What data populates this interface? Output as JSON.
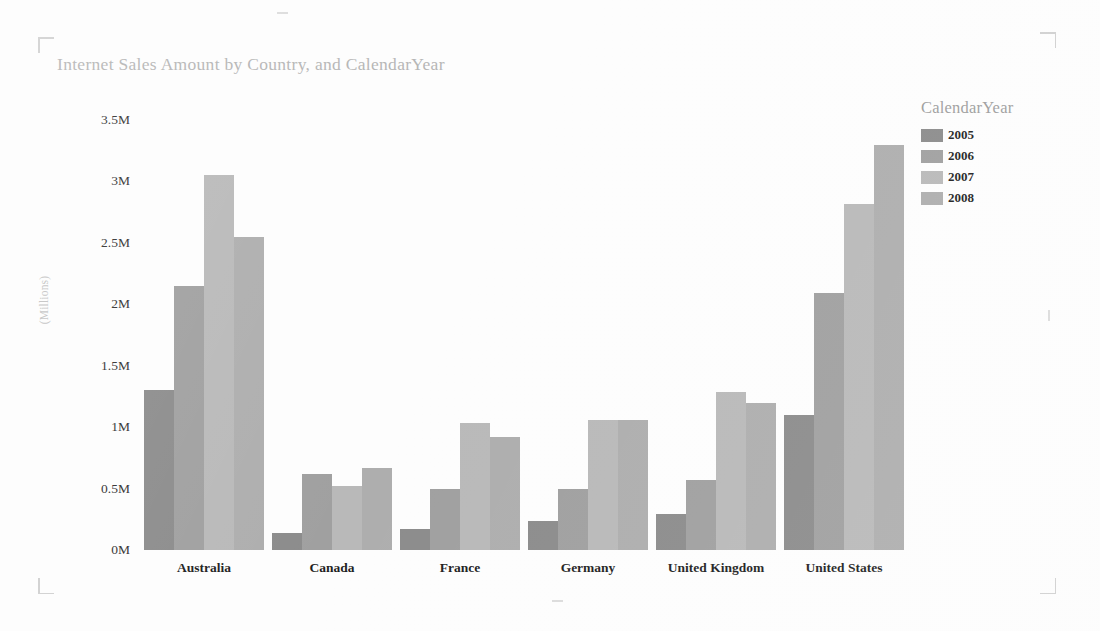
{
  "chart_data": {
    "type": "bar",
    "title": "Internet Sales Amount by Country, and CalendarYear",
    "xlabel": "",
    "ylabel": "(Millions)",
    "ylim": [
      0,
      3.5
    ],
    "ytick_labels": [
      "3.5M",
      "3M",
      "2.5M",
      "2M",
      "1.5M",
      "1M",
      "0.5M",
      "0M"
    ],
    "ytick_values": [
      3.5,
      3,
      2.5,
      2,
      1.5,
      1,
      0.5,
      0
    ],
    "grid": false,
    "legend_position": "right",
    "legend_title": "CalendarYear",
    "categories": [
      "Australia",
      "Canada",
      "France",
      "Germany",
      "United Kingdom",
      "United States"
    ],
    "series": [
      {
        "name": "2005",
        "color": "#8c8c8c",
        "values": [
          1.3,
          0.14,
          0.17,
          0.24,
          0.29,
          1.1
        ]
      },
      {
        "name": "2006",
        "color": "#a0a0a0",
        "values": [
          2.15,
          0.62,
          0.5,
          0.5,
          0.57,
          2.09
        ]
      },
      {
        "name": "2007",
        "color": "#b9b9b9",
        "values": [
          3.05,
          0.52,
          1.03,
          1.06,
          1.29,
          2.82
        ]
      },
      {
        "name": "2008",
        "color": "#aeaeae",
        "values": [
          2.55,
          0.67,
          0.92,
          1.06,
          1.2,
          3.3
        ]
      }
    ]
  },
  "page": {
    "crop_marks": [
      "top-left",
      "top-right",
      "bottom-left",
      "bottom-right"
    ]
  }
}
